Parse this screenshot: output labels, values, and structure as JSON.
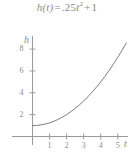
{
  "figure": {
    "equation": {
      "function_name": "h",
      "variable": "t",
      "lhs": "h(t)",
      "equals": "=",
      "coefficient": ".25",
      "power": "2",
      "plus": "+",
      "constant": "1",
      "full_text": "h(t) = .25t² + 1"
    },
    "axis_labels": {
      "y": "h",
      "x": "t"
    },
    "colors": {
      "curve": "#7d7d7d",
      "axis": "#9a9a9a",
      "text": "#8c8c8c",
      "background": "#ffffff"
    }
  },
  "chart_data": {
    "type": "line",
    "xlabel": "t",
    "ylabel": "h",
    "grid": false,
    "legend": "none",
    "xlim": [
      0,
      5.6
    ],
    "ylim": [
      0,
      9.2
    ],
    "xticks": [
      1,
      2,
      3,
      4,
      5
    ],
    "yticks": [
      2,
      4,
      6,
      8
    ],
    "xtick_labels": [
      "1",
      "2",
      "3",
      "4",
      "5"
    ],
    "ytick_labels": [
      "2",
      "4",
      "6",
      "8"
    ],
    "series": [
      {
        "name": "h(t) = .25t² + 1",
        "equation": "0.25*t^2 + 1",
        "x": [
          0,
          0.25,
          0.5,
          0.75,
          1,
          1.25,
          1.5,
          1.75,
          2,
          2.25,
          2.5,
          2.75,
          3,
          3.25,
          3.5,
          3.75,
          4,
          4.25,
          4.5,
          4.75,
          5,
          5.25,
          5.5
        ],
        "y": [
          1,
          1.016,
          1.063,
          1.141,
          1.25,
          1.391,
          1.563,
          1.766,
          2,
          2.266,
          2.563,
          2.891,
          3.25,
          3.641,
          4.063,
          4.516,
          5,
          5.516,
          6.063,
          6.641,
          7.25,
          7.891,
          8.563
        ]
      }
    ]
  }
}
